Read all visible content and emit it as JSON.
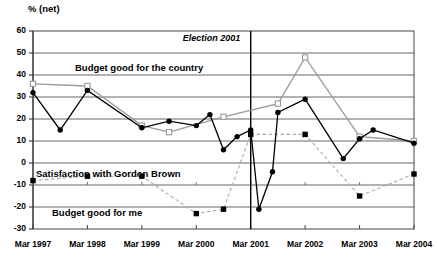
{
  "chart_data": {
    "type": "line",
    "title": "",
    "ylabel": "% (net)",
    "xlabel": "",
    "ylim": [
      -30,
      60
    ],
    "yticks": [
      60,
      50,
      40,
      30,
      20,
      10,
      0,
      -10,
      -20,
      -30
    ],
    "ytick_labels": [
      "60",
      "50",
      "40",
      "30",
      "20",
      "10",
      "0",
      "-10",
      "-20",
      "-30"
    ],
    "grid": true,
    "legend": "inline-labels",
    "categories": [
      "Mar 1997",
      "Mar 1998",
      "Mar 1999",
      "Mar 2000",
      "Mar 2001",
      "Mar 2002",
      "Mar 2003",
      "Mar 2004"
    ],
    "x_range": [
      1997.2,
      2004.2
    ],
    "annotations": [
      {
        "text": "Election 2001",
        "x": 2001.2,
        "style": "italic",
        "vline": true
      }
    ],
    "series": [
      {
        "name": "Budget good for the country",
        "marker": "open-square",
        "color": "#9a9a9a",
        "line": "solid",
        "points": [
          {
            "x": 1997.2,
            "y": 36
          },
          {
            "x": 1998.2,
            "y": 35
          },
          {
            "x": 1999.2,
            "y": 17
          },
          {
            "x": 1999.7,
            "y": 14
          },
          {
            "x": 2000.7,
            "y": 21
          },
          {
            "x": 2001.7,
            "y": 27
          },
          {
            "x": 2002.2,
            "y": 48
          },
          {
            "x": 2003.2,
            "y": 12
          },
          {
            "x": 2004.2,
            "y": 10
          }
        ]
      },
      {
        "name": "Satisfaction with Gordon Brown",
        "marker": "filled-circle",
        "color": "#000000",
        "line": "solid",
        "points": [
          {
            "x": 1997.2,
            "y": 32
          },
          {
            "x": 1997.7,
            "y": 15
          },
          {
            "x": 1998.2,
            "y": 33
          },
          {
            "x": 1999.2,
            "y": 16
          },
          {
            "x": 1999.7,
            "y": 19
          },
          {
            "x": 2000.2,
            "y": 17
          },
          {
            "x": 2000.45,
            "y": 22
          },
          {
            "x": 2000.7,
            "y": 6
          },
          {
            "x": 2000.95,
            "y": 12
          },
          {
            "x": 2001.2,
            "y": 15
          },
          {
            "x": 2001.35,
            "y": -21
          },
          {
            "x": 2001.6,
            "y": -4
          },
          {
            "x": 2001.7,
            "y": 23
          },
          {
            "x": 2002.2,
            "y": 29
          },
          {
            "x": 2002.9,
            "y": 2
          },
          {
            "x": 2003.2,
            "y": 11
          },
          {
            "x": 2003.45,
            "y": 15
          },
          {
            "x": 2004.2,
            "y": 9
          }
        ]
      },
      {
        "name": "Budget good for me",
        "marker": "filled-square",
        "color": "#000000",
        "line": "dashed",
        "points": [
          {
            "x": 1997.2,
            "y": -8
          },
          {
            "x": 1998.2,
            "y": -6
          },
          {
            "x": 1999.2,
            "y": -6
          },
          {
            "x": 2000.2,
            "y": -23
          },
          {
            "x": 2000.7,
            "y": -21
          },
          {
            "x": 2001.2,
            "y": 13
          },
          {
            "x": 2002.2,
            "y": 13
          },
          {
            "x": 2003.2,
            "y": -15
          },
          {
            "x": 2004.2,
            "y": -5
          }
        ]
      }
    ],
    "series_labels": [
      {
        "text": "Budget good for the country",
        "x_px": 75,
        "y_px": 62
      },
      {
        "text": "Satisfaction with Gordon Brown",
        "x_px": 36,
        "y_px": 168
      },
      {
        "text": "Budget good for me",
        "x_px": 52,
        "y_px": 207
      }
    ]
  }
}
